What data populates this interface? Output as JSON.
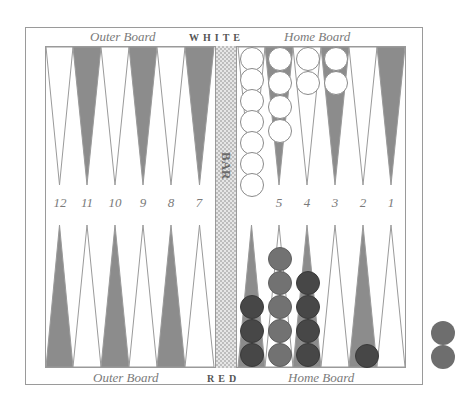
{
  "board": {
    "top_labels": {
      "left": "Outer Board",
      "center": "WHITE",
      "right": "Home Board"
    },
    "bottom_labels": {
      "left": "Outer Board",
      "center": "RED",
      "right": "Home Board"
    },
    "bar_label": "BAR",
    "point_numbers": {
      "left": [
        "12",
        "11",
        "10",
        "9",
        "8",
        "7"
      ],
      "right": [
        "5",
        "4",
        "3",
        "2",
        "1"
      ]
    },
    "colors": {
      "dark_point": "#8c8c8c",
      "light_point": "#ffffff",
      "point_outline": "#9a9a9a",
      "white_checker": "#ffffff",
      "red_checker": "#474747",
      "red_checker_light": "#727272"
    }
  },
  "position": {
    "white": [
      {
        "point": 6,
        "count": 7
      },
      {
        "point": 5,
        "count": 4
      },
      {
        "point": 4,
        "count": 2
      },
      {
        "point": 3,
        "count": 2
      }
    ],
    "red": [
      {
        "point": 6,
        "count": 3
      },
      {
        "point": 5,
        "count": 5
      },
      {
        "point": 4,
        "count": 4
      },
      {
        "point": 1,
        "count": 1
      }
    ],
    "red_borne_off": 2
  }
}
